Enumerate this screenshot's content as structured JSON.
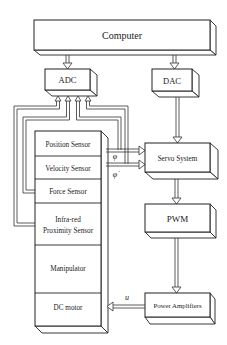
{
  "diagram": {
    "computer": {
      "label": "Computer"
    },
    "adc": {
      "label": "ADC"
    },
    "dac": {
      "label": "DAC"
    },
    "servo": {
      "label": "Servo System"
    },
    "pwm": {
      "label": "PWM"
    },
    "power": {
      "label": "Power Amplifiers"
    },
    "stack": {
      "position": "Position Sensor",
      "velocity": "Velocity Sensor",
      "force": "Force Sensor",
      "infrared_1": "Infra-red",
      "infrared_2": "Proximity Sensor",
      "manipulator": "Manipulator",
      "motor": "DC motor"
    },
    "signals": {
      "phi": "φ",
      "phi_dot": "φ̇",
      "u": "u"
    }
  }
}
